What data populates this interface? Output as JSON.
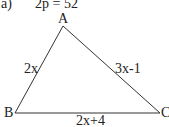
{
  "problem": {
    "label": "a)",
    "perimeter": "2p = 52"
  },
  "triangle": {
    "vertices": {
      "A": "A",
      "B": "B",
      "C": "C"
    },
    "sides": {
      "AB": "2x",
      "AC": "3x-1",
      "BC": "2x+4"
    }
  },
  "colors": {
    "stroke": "#333333",
    "text": "#222222"
  }
}
